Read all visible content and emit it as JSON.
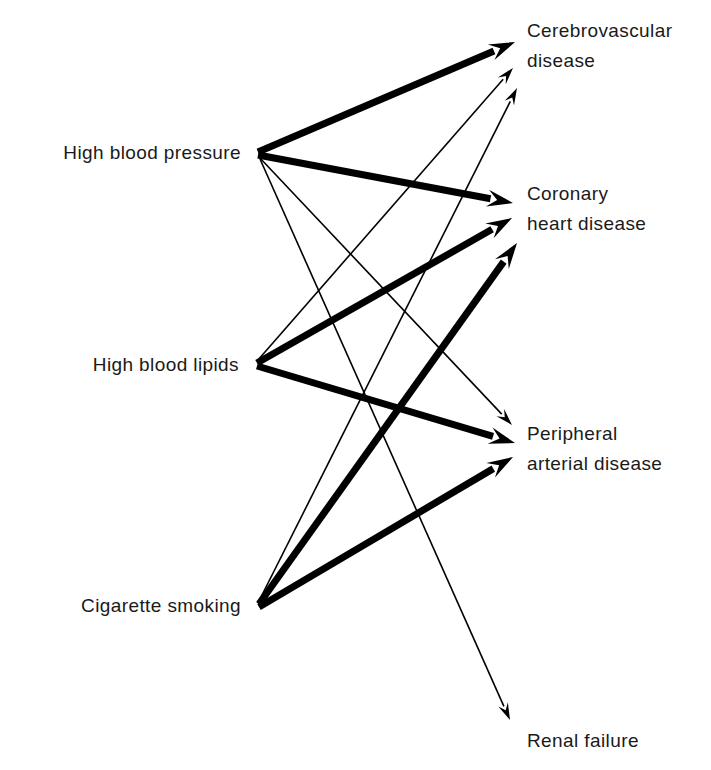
{
  "diagram": {
    "type": "directed-graph",
    "title": "",
    "background_color": "#ffffff",
    "line_color": "#000000",
    "text_color": "#1a1a1a",
    "risk_factors": [
      {
        "id": "hbp",
        "label": "High blood pressure",
        "x": 258,
        "y": 152
      },
      {
        "id": "lipids",
        "label": "High blood lipids",
        "x": 256,
        "y": 364
      },
      {
        "id": "smoking",
        "label": "Cigarette smoking",
        "x": 258,
        "y": 605
      }
    ],
    "outcomes": [
      {
        "id": "cvd",
        "label_line1": "Cerebrovascular",
        "label_line2": "disease",
        "x": 527,
        "y": 42
      },
      {
        "id": "chd",
        "label_line1": "Coronary",
        "label_line2": "heart disease",
        "x": 527,
        "y": 205
      },
      {
        "id": "pad",
        "label_line1": "Peripheral",
        "label_line2": "arterial disease",
        "x": 527,
        "y": 445
      },
      {
        "id": "renal",
        "label_line1": "Renal failure",
        "label_line2": "",
        "x": 527,
        "y": 752
      }
    ],
    "edges": [
      {
        "from": "hbp",
        "to": "cvd",
        "weight": "strong",
        "stroke_width": 7,
        "x1": 258,
        "y1": 152,
        "x2": 515,
        "y2": 42
      },
      {
        "from": "hbp",
        "to": "chd",
        "weight": "strong",
        "stroke_width": 7,
        "x1": 258,
        "y1": 155,
        "x2": 513,
        "y2": 203
      },
      {
        "from": "hbp",
        "to": "pad",
        "weight": "weak",
        "stroke_width": 1.6,
        "x1": 259,
        "y1": 157,
        "x2": 512,
        "y2": 425
      },
      {
        "from": "hbp",
        "to": "renal",
        "weight": "weak",
        "stroke_width": 1.6,
        "x1": 260,
        "y1": 159,
        "x2": 510,
        "y2": 720
      },
      {
        "from": "lipids",
        "to": "cvd",
        "weight": "weak",
        "stroke_width": 1.6,
        "x1": 258,
        "y1": 360,
        "x2": 513,
        "y2": 68
      },
      {
        "from": "lipids",
        "to": "chd",
        "weight": "strong",
        "stroke_width": 7,
        "x1": 257,
        "y1": 363,
        "x2": 512,
        "y2": 218
      },
      {
        "from": "lipids",
        "to": "pad",
        "weight": "strong",
        "stroke_width": 7,
        "x1": 257,
        "y1": 366,
        "x2": 515,
        "y2": 443
      },
      {
        "from": "smoking",
        "to": "cvd",
        "weight": "weak",
        "stroke_width": 1.6,
        "x1": 259,
        "y1": 601,
        "x2": 517,
        "y2": 88
      },
      {
        "from": "smoking",
        "to": "chd",
        "weight": "strong",
        "stroke_width": 7,
        "x1": 259,
        "y1": 604,
        "x2": 517,
        "y2": 243
      },
      {
        "from": "smoking",
        "to": "pad",
        "weight": "strong",
        "stroke_width": 7,
        "x1": 259,
        "y1": 607,
        "x2": 513,
        "y2": 457
      }
    ]
  }
}
